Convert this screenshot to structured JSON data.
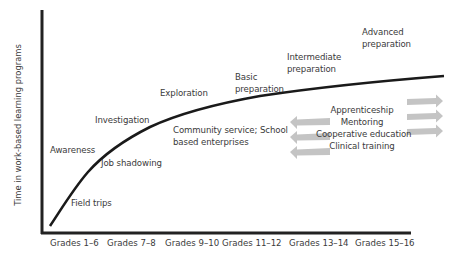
{
  "diagram": {
    "type": "conceptual curve",
    "y_axis_label": "Time in work-based learning programs",
    "x_axis_ticks": [
      "Grades 1–6",
      "Grades 7–8",
      "Grades 9–10",
      "Grades 11–12",
      "Grades 13–14",
      "Grades 15–16"
    ],
    "stages": [
      {
        "label": "Awareness"
      },
      {
        "label": "Investigation"
      },
      {
        "label": "Exploration"
      },
      {
        "label_line1": "Basic",
        "label_line2": "preparation"
      },
      {
        "label_line1": "Intermediate",
        "label_line2": "preparation"
      },
      {
        "label_line1": "Advanced",
        "label_line2": "preparation"
      }
    ],
    "activities": {
      "field_trips": "Field trips",
      "job_shadowing": "Job shadowing",
      "community_line1": "Community service; School",
      "community_line2": "based enterprises",
      "advanced_list": [
        "Apprenticeship",
        "Mentoring",
        "Cooperative education",
        "Clinical training"
      ]
    },
    "colors": {
      "axis": "#222222",
      "curve": "#1a1a1a",
      "arrow": "#c4c4c4",
      "text": "#3a3a3a"
    }
  }
}
